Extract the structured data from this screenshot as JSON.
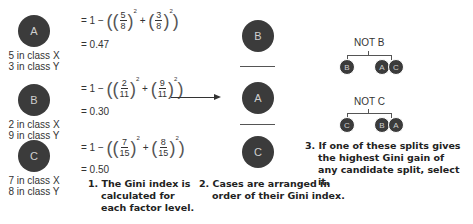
{
  "levels": [
    {
      "name": "A",
      "class_x": "5 in class X",
      "class_y": "3 in class Y",
      "formula_prefix": "= 1 −",
      "frac1_num": "5",
      "frac1_den": "8",
      "frac2_num": "3",
      "frac2_den": "8",
      "exponent": "2",
      "plus": "+",
      "result": "= 0.47"
    },
    {
      "name": "B",
      "class_x": "2 in class X",
      "class_y": "9 in class Y",
      "formula_prefix": "= 1 −",
      "frac1_num": "2",
      "frac1_den": "11",
      "frac2_num": "9",
      "frac2_den": "11",
      "exponent": "2",
      "plus": "+",
      "result": "= 0.30"
    },
    {
      "name": "C",
      "class_x": "7 in class X",
      "class_y": "8 in class Y",
      "formula_prefix": "= 1 −",
      "frac1_num": "7",
      "frac1_den": "15",
      "frac2_num": "8",
      "frac2_den": "15",
      "exponent": "2",
      "plus": "+",
      "result": "= 0.50"
    }
  ],
  "ordered": [
    "B",
    "A",
    "C"
  ],
  "splits": [
    {
      "label": "NOT B",
      "left": "B",
      "right": [
        "A",
        "C"
      ]
    },
    {
      "label": "NOT C",
      "left": "C",
      "right": [
        "B",
        "A"
      ]
    }
  ],
  "captions": {
    "step1": [
      "1. The Gini index is",
      "calculated for",
      "each factor level."
    ],
    "step2": [
      "2. Cases are arranged in",
      "order of their Gini index."
    ],
    "step3": [
      "3. If one of these splits gives",
      "the highest Gini gain of",
      "any candidate split, select it."
    ]
  },
  "colors": {
    "node": "#3b3b3b",
    "node_text": "#cfcfcf",
    "line": "#555555"
  }
}
